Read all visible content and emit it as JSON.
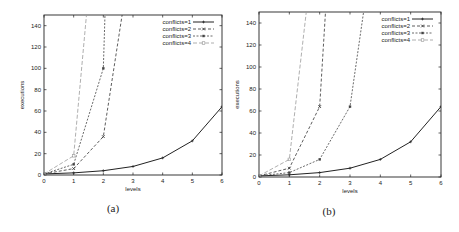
{
  "chart_data": [
    {
      "type": "line",
      "panel": "(a)",
      "title": "",
      "xlabel": "levels",
      "ylabel": "executions",
      "xlim": [
        0,
        6
      ],
      "ylim": [
        0,
        150
      ],
      "xticks": [
        0,
        1,
        2,
        3,
        4,
        5,
        6
      ],
      "yticks": [
        0,
        20,
        40,
        60,
        80,
        100,
        120,
        140
      ],
      "grid": false,
      "legend_position": "top-right",
      "series": [
        {
          "name": "conflicts=1",
          "x": [
            0,
            1,
            2,
            3,
            4,
            5,
            6
          ],
          "values": [
            1,
            2,
            4,
            8,
            16,
            32,
            64
          ]
        },
        {
          "name": "conflicts=2",
          "x": [
            0,
            1,
            2,
            3
          ],
          "values": [
            1,
            6,
            36,
            216
          ]
        },
        {
          "name": "conflicts=3",
          "x": [
            0,
            1,
            2,
            3
          ],
          "values": [
            1,
            10,
            100,
            1000
          ]
        },
        {
          "name": "conflicts=4",
          "x": [
            0,
            1,
            2
          ],
          "values": [
            1,
            18,
            324
          ]
        }
      ]
    },
    {
      "type": "line",
      "panel": "(b)",
      "title": "",
      "xlabel": "levels",
      "ylabel": "executions",
      "xlim": [
        0,
        6
      ],
      "ylim": [
        0,
        150
      ],
      "xticks": [
        0,
        1,
        2,
        3,
        4,
        5,
        6
      ],
      "yticks": [
        0,
        20,
        40,
        60,
        80,
        100,
        120,
        140
      ],
      "grid": false,
      "legend_position": "top-right",
      "series": [
        {
          "name": "conflicts=1",
          "x": [
            0,
            1,
            2,
            3,
            4,
            5,
            6
          ],
          "values": [
            1,
            2,
            4,
            8,
            16,
            32,
            64
          ]
        },
        {
          "name": "conflicts=2",
          "x": [
            0,
            1,
            2,
            3
          ],
          "values": [
            1,
            8,
            64,
            512
          ]
        },
        {
          "name": "conflicts=3",
          "x": [
            0,
            1,
            2,
            3,
            4
          ],
          "values": [
            1,
            4,
            16,
            64,
            256
          ]
        },
        {
          "name": "conflicts=4",
          "x": [
            0,
            1,
            2
          ],
          "values": [
            1,
            16,
            256
          ]
        }
      ]
    }
  ],
  "styles": {
    "series_colors": [
      "#222222",
      "#333333",
      "#444444",
      "#9a9a9a"
    ],
    "series_dash": [
      "",
      "3,2",
      "2,1.5",
      "4,2"
    ],
    "series_marker": [
      "plus",
      "cross",
      "square",
      "circle"
    ]
  },
  "layout": {
    "panels": [
      {
        "left": 44,
        "right": 222,
        "top": 15,
        "bottom": 175,
        "caption_x": 113,
        "caption_y": 212
      },
      {
        "left": 259,
        "right": 441,
        "top": 12,
        "bottom": 177,
        "caption_x": 329,
        "caption_y": 215
      }
    ]
  }
}
